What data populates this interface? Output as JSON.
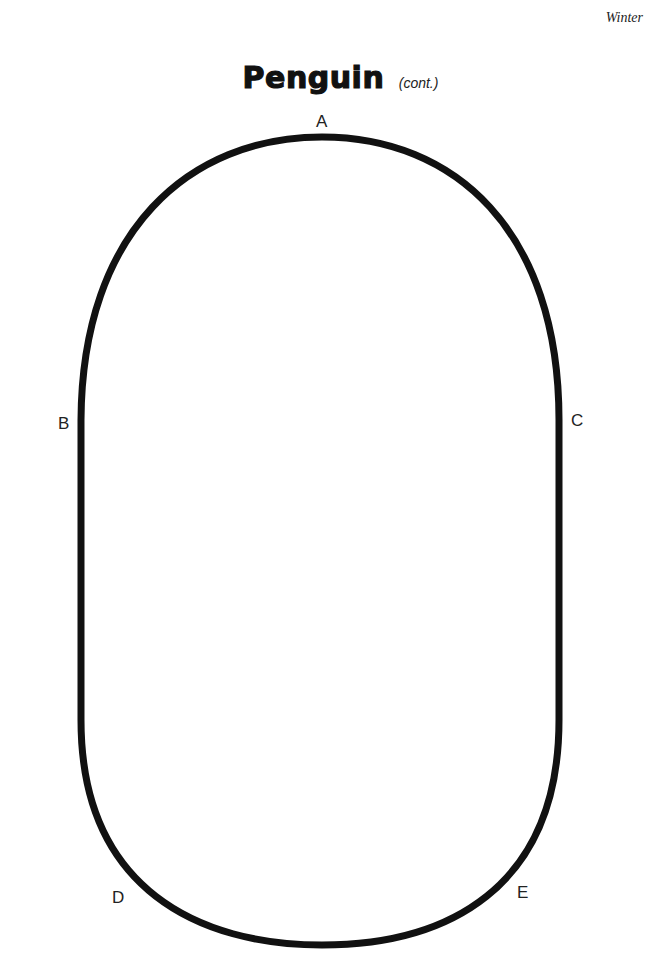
{
  "header": {
    "section_label": "Winter"
  },
  "title": {
    "main": "Penguin",
    "sub": "(cont.)"
  },
  "template": {
    "shape": "rounded-oval-outline",
    "stroke_color": "#111111",
    "points": [
      {
        "label": "A",
        "position": "top"
      },
      {
        "label": "B",
        "position": "left"
      },
      {
        "label": "C",
        "position": "right"
      },
      {
        "label": "D",
        "position": "bottom-left"
      },
      {
        "label": "E",
        "position": "bottom-right"
      }
    ]
  }
}
